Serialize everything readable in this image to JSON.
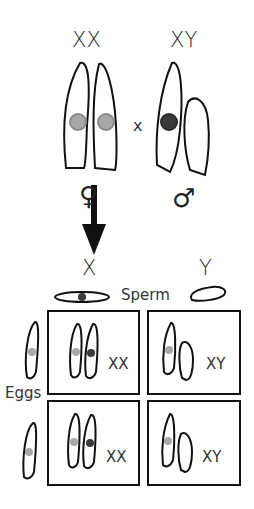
{
  "diagram": {
    "parents": {
      "female_label": "XX",
      "male_label": "XY",
      "cross_symbol": "x",
      "female_symbol": "♀",
      "male_symbol": "♂"
    },
    "gametes": {
      "sperm_x_label": "X",
      "sperm_y_label": "Y",
      "sperm_label": "Sperm",
      "eggs_label": "Eggs"
    },
    "offspring": [
      {
        "row": 1,
        "col": 1,
        "genotype": "XX"
      },
      {
        "row": 1,
        "col": 2,
        "genotype": "XY"
      },
      {
        "row": 2,
        "col": 1,
        "genotype": "XX"
      },
      {
        "row": 2,
        "col": 2,
        "genotype": "XY"
      }
    ],
    "colors": {
      "outline": "#111111",
      "maternal_allele": "#9a9a9a",
      "paternal_allele": "#3a3a3a",
      "arrow": "#111111"
    }
  }
}
